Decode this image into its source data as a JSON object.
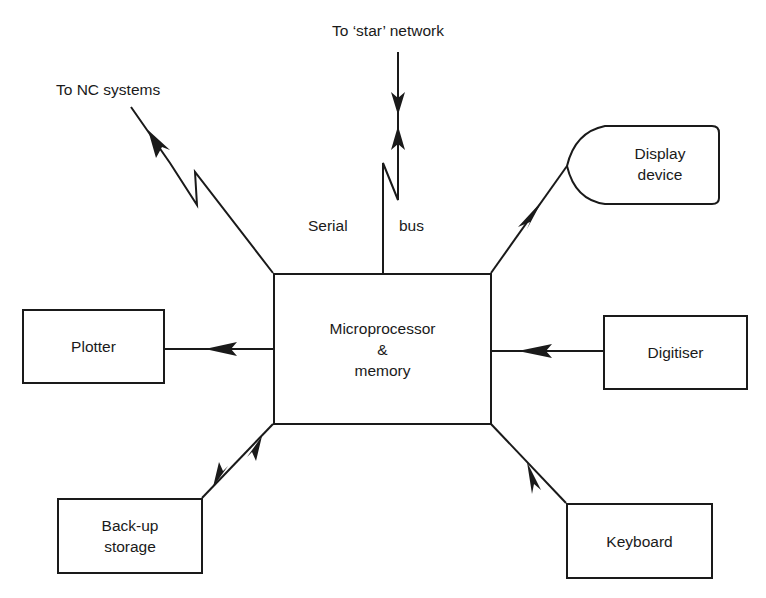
{
  "diagram": {
    "central": {
      "line1": "Microprocessor",
      "line2": "&",
      "line3": "memory"
    },
    "nodes": {
      "plotter": {
        "label": "Plotter"
      },
      "digitiser": {
        "label": "Digitiser"
      },
      "backup": {
        "line1": "Back-up",
        "line2": "storage"
      },
      "keyboard": {
        "label": "Keyboard"
      },
      "display": {
        "line1": "Display",
        "line2": "device"
      }
    },
    "labels": {
      "nc": "To NC systems",
      "star": "To ‘star’ network",
      "serial": "Serial",
      "bus": "bus"
    },
    "edges": [
      {
        "from": "microprocessor",
        "to": "plotter",
        "direction": "out"
      },
      {
        "from": "digitiser",
        "to": "microprocessor",
        "direction": "in"
      },
      {
        "from": "keyboard",
        "to": "microprocessor",
        "direction": "in"
      },
      {
        "from": "microprocessor",
        "to": "backup",
        "direction": "bidirectional"
      },
      {
        "from": "microprocessor",
        "to": "display",
        "direction": "out"
      },
      {
        "from": "microprocessor",
        "to": "nc",
        "direction": "out",
        "style": "zigzag"
      },
      {
        "from": "microprocessor",
        "to": "star",
        "direction": "bidirectional",
        "style": "zigzag",
        "label": "Serial bus"
      }
    ]
  }
}
